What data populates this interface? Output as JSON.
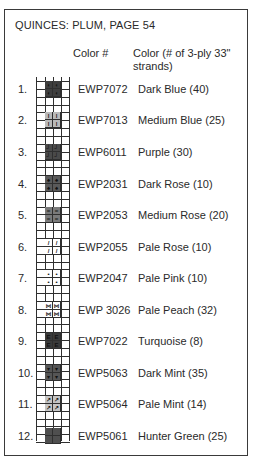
{
  "title": "QUINCES: PLUM, PAGE 54",
  "headers": {
    "code": "Color #",
    "color": "Color (# of 3-ply 33\" strands)"
  },
  "items": [
    {
      "num": "1.",
      "code": "EWP7072",
      "name": "Dark Blue (40)",
      "fill": "#3e3e3e",
      "symbol": "◖",
      "top": 81
    },
    {
      "num": "2.",
      "code": "EWP7013",
      "name": "Medium Blue (25)",
      "fill": "#b9b9b9",
      "symbol": "ǀ",
      "top": 112
    },
    {
      "num": "3.",
      "code": "EWP6011",
      "name": "Purple (30)",
      "fill": "#4a4a4a",
      "symbol": "┘",
      "top": 144
    },
    {
      "num": "4.",
      "code": "EWP2031",
      "name": "Dark Rose (10)",
      "fill": "#5a5a5a",
      "symbol": "♠",
      "top": 176
    },
    {
      "num": "5.",
      "code": "EWP2053",
      "name": "Medium Rose (20)",
      "fill": "#7a7a7a",
      "symbol": "=",
      "top": 207
    },
    {
      "num": "6.",
      "code": "EWP2055",
      "name": "Pale Rose (10)",
      "fill": "#ffffff",
      "symbol": "/",
      "top": 239
    },
    {
      "num": "7.",
      "code": "EWP2047",
      "name": "Pale Pink (10)",
      "fill": "#ffffff",
      "symbol": "•",
      "top": 270
    },
    {
      "num": "8.",
      "code": "EWP 3026",
      "name": "Pale Peach (32)",
      "fill": "#ffffff",
      "symbol": "⋈",
      "top": 302
    },
    {
      "num": "9.",
      "code": "EWP7022",
      "name": "Turquoise (8)",
      "fill": "#3a3a3a",
      "symbol": "E",
      "top": 333
    },
    {
      "num": "10.",
      "code": "EWP5063",
      "name": "Dark Mint (35)",
      "fill": "#555555",
      "symbol": "▾",
      "top": 365
    },
    {
      "num": "11.",
      "code": "EWP5064",
      "name": "Pale Mint (14)",
      "fill": "#c4c4c4",
      "symbol": "↗",
      "top": 396
    },
    {
      "num": "12.",
      "code": "EWP5061",
      "name": "Hunter Green (25)",
      "fill": "#4f4f4f",
      "symbol": "",
      "top": 428
    }
  ]
}
